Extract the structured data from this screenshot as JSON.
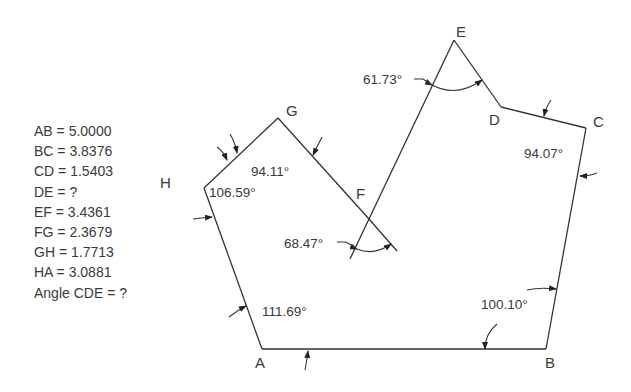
{
  "given": [
    "AB = 5.0000",
    "BC = 3.8376",
    "CD = 1.5403",
    "DE = ?",
    "EF = 3.4361",
    "FG = 2.3679",
    "GH = 1.7713",
    "HA = 3.0881",
    "Angle CDE = ?"
  ],
  "vertices": {
    "A": "A",
    "B": "B",
    "C": "C",
    "D": "D",
    "E": "E",
    "F": "F",
    "G": "G",
    "H": "H"
  },
  "angles": {
    "A": "111.69°",
    "B": "100.10°",
    "C": "94.07°",
    "E": "61.73°",
    "F": "68.47°",
    "G": "94.11°",
    "H": "106.59°"
  },
  "colors": {
    "line": "#333333",
    "text": "#3a3a3a",
    "background": "#ffffff"
  }
}
